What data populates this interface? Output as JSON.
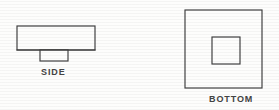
{
  "drawing": {
    "title": "Orthographic part sketch",
    "background_color": "#fdfdfc",
    "line_color": "#3c3c3c",
    "label_color": "#434343",
    "views": [
      {
        "id": "side",
        "label": "SIDE",
        "description": "Rectangular body with small centered boss projecting downward",
        "shapes": [
          {
            "name": "side-body-rect",
            "type": "rect",
            "x": 17,
            "y": 26,
            "width": 78,
            "height": 24
          },
          {
            "name": "side-boss-rect",
            "type": "rect",
            "x": 40,
            "y": 50,
            "width": 28,
            "height": 11
          }
        ],
        "label_position": {
          "x": 41,
          "y": 66
        }
      },
      {
        "id": "bottom",
        "label": "BOTTOM",
        "description": "Large square outline with smaller concentric square inside",
        "shapes": [
          {
            "name": "bottom-outer-square",
            "type": "rect",
            "x": 185,
            "y": 10,
            "width": 77,
            "height": 78
          },
          {
            "name": "bottom-inner-square",
            "type": "rect",
            "x": 212,
            "y": 37,
            "width": 28,
            "height": 27
          }
        ],
        "label_position": {
          "x": 209,
          "y": 93
        }
      }
    ]
  }
}
